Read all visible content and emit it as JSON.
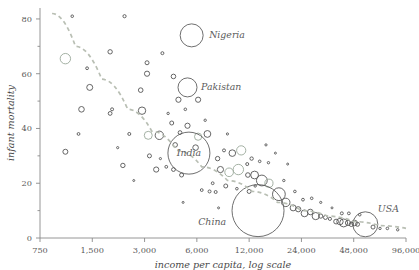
{
  "chart_data": {
    "type": "scatter",
    "title": "",
    "subtitle": "",
    "xlabel": "income per capita, log scale",
    "ylabel": "infant mortality",
    "xscale": "log",
    "yscale": "linear",
    "xlim": [
      750,
      96000
    ],
    "ylim": [
      0,
      84
    ],
    "xticks": [
      750,
      1500,
      3000,
      6000,
      12000,
      24000,
      48000,
      96000
    ],
    "xticklabels": [
      "750",
      "1,500",
      "3,000",
      "6,000",
      "12,000",
      "24,000",
      "48,000",
      "96,000"
    ],
    "yticks": [
      0,
      20,
      40,
      60,
      80
    ],
    "yticklabels": [
      "0",
      "20",
      "40",
      "60",
      "80"
    ],
    "yminorticks": [
      10,
      30,
      50,
      70
    ],
    "grid": false,
    "legend": null,
    "size_encoding": "population",
    "marker": "open-circle",
    "colors": {
      "bubble_stroke_dark": "#555555",
      "bubble_stroke_light": "#9aa89a",
      "trendline": "#b9bfb4",
      "axis": "#8a8a8a",
      "text": "#5a5a5a"
    },
    "annotations": [
      {
        "name": "Nigeria",
        "x": 5600,
        "y": 74,
        "r": 11.5,
        "label_dx": 14,
        "label_dy": 3
      },
      {
        "name": "Pakistan",
        "x": 5300,
        "y": 55,
        "r": 9.5,
        "label_dx": 12,
        "label_dy": 3
      },
      {
        "name": "India",
        "x": 5400,
        "y": 31,
        "r": 21,
        "label_dx": 0,
        "label_dy": 3,
        "label_inside": true
      },
      {
        "name": "China",
        "x": 13500,
        "y": 10,
        "r": 26,
        "label_dx": -32,
        "label_dy": 14
      },
      {
        "name": "USA",
        "x": 56000,
        "y": 5,
        "r": 12.5,
        "label_dx": 8,
        "label_dy": -12
      }
    ],
    "trendline_points": [
      {
        "x": 880,
        "y": 82
      },
      {
        "x": 1200,
        "y": 70
      },
      {
        "x": 1700,
        "y": 58
      },
      {
        "x": 2400,
        "y": 47
      },
      {
        "x": 3300,
        "y": 39
      },
      {
        "x": 4600,
        "y": 32
      },
      {
        "x": 6400,
        "y": 26
      },
      {
        "x": 9000,
        "y": 21
      },
      {
        "x": 12500,
        "y": 17
      },
      {
        "x": 17500,
        "y": 13
      },
      {
        "x": 24000,
        "y": 10
      },
      {
        "x": 34000,
        "y": 8
      },
      {
        "x": 48000,
        "y": 6
      },
      {
        "x": 68000,
        "y": 4.5
      },
      {
        "x": 96000,
        "y": 3.5
      }
    ],
    "points": [
      {
        "x": 1150,
        "y": 81,
        "r": 1.3
      },
      {
        "x": 2300,
        "y": 81,
        "r": 1.6
      },
      {
        "x": 1900,
        "y": 68,
        "r": 2.2
      },
      {
        "x": 1050,
        "y": 65.5,
        "r": 5.2
      },
      {
        "x": 1400,
        "y": 62,
        "r": 1.4
      },
      {
        "x": 3100,
        "y": 64,
        "r": 2.0
      },
      {
        "x": 3100,
        "y": 60,
        "r": 2.6
      },
      {
        "x": 4400,
        "y": 59,
        "r": 2.3
      },
      {
        "x": 1450,
        "y": 55,
        "r": 3.0
      },
      {
        "x": 2850,
        "y": 54,
        "r": 2.3
      },
      {
        "x": 5300,
        "y": 55,
        "r": 9.5
      },
      {
        "x": 4700,
        "y": 50.5,
        "r": 2.6
      },
      {
        "x": 6100,
        "y": 50.5,
        "r": 2.6
      },
      {
        "x": 5150,
        "y": 47,
        "r": 1.3
      },
      {
        "x": 1300,
        "y": 47,
        "r": 2.8
      },
      {
        "x": 1950,
        "y": 47,
        "r": 1.5
      },
      {
        "x": 1900,
        "y": 45.5,
        "r": 1.9
      },
      {
        "x": 2900,
        "y": 46.5,
        "r": 3.7
      },
      {
        "x": 4100,
        "y": 45.5,
        "r": 1.2
      },
      {
        "x": 3800,
        "y": 67.5,
        "r": 1.5
      },
      {
        "x": 5600,
        "y": 74,
        "r": 11.5
      },
      {
        "x": 4300,
        "y": 42,
        "r": 2.0
      },
      {
        "x": 5300,
        "y": 41,
        "r": 2.6
      },
      {
        "x": 4800,
        "y": 38.5,
        "r": 1.9
      },
      {
        "x": 1250,
        "y": 38,
        "r": 1.4
      },
      {
        "x": 2450,
        "y": 38,
        "r": 1.5
      },
      {
        "x": 3150,
        "y": 37.5,
        "r": 4.0
      },
      {
        "x": 3650,
        "y": 37.5,
        "r": 4.2
      },
      {
        "x": 6100,
        "y": 37,
        "r": 3.6
      },
      {
        "x": 6900,
        "y": 38,
        "r": 3.4
      },
      {
        "x": 4500,
        "y": 34,
        "r": 2.3
      },
      {
        "x": 5900,
        "y": 33,
        "r": 2.8
      },
      {
        "x": 5400,
        "y": 31,
        "r": 21
      },
      {
        "x": 1050,
        "y": 31.5,
        "r": 2.5
      },
      {
        "x": 2250,
        "y": 26.5,
        "r": 2.2
      },
      {
        "x": 3200,
        "y": 30,
        "r": 2.0
      },
      {
        "x": 3700,
        "y": 29,
        "r": 1.1
      },
      {
        "x": 4000,
        "y": 26,
        "r": 1.4
      },
      {
        "x": 3500,
        "y": 25,
        "r": 2.6
      },
      {
        "x": 4400,
        "y": 25,
        "r": 1.9
      },
      {
        "x": 4900,
        "y": 23,
        "r": 2.0
      },
      {
        "x": 7900,
        "y": 29,
        "r": 2.2
      },
      {
        "x": 8600,
        "y": 32,
        "r": 1.5
      },
      {
        "x": 9600,
        "y": 31,
        "r": 3.3
      },
      {
        "x": 10800,
        "y": 32,
        "r": 4.6
      },
      {
        "x": 12400,
        "y": 29,
        "r": 1.7
      },
      {
        "x": 8200,
        "y": 25,
        "r": 3.1
      },
      {
        "x": 9200,
        "y": 24,
        "r": 4.3
      },
      {
        "x": 10400,
        "y": 25,
        "r": 5.2
      },
      {
        "x": 11800,
        "y": 23,
        "r": 2.3
      },
      {
        "x": 7400,
        "y": 20,
        "r": 1.4
      },
      {
        "x": 8800,
        "y": 19,
        "r": 2.0
      },
      {
        "x": 6400,
        "y": 17.5,
        "r": 1.4
      },
      {
        "x": 7100,
        "y": 17,
        "r": 1.5
      },
      {
        "x": 7700,
        "y": 16.8,
        "r": 1.5
      },
      {
        "x": 10200,
        "y": 18,
        "r": 1.3
      },
      {
        "x": 12000,
        "y": 17,
        "r": 2.0
      },
      {
        "x": 13000,
        "y": 19,
        "r": 1.2
      },
      {
        "x": 12900,
        "y": 23,
        "r": 3.9
      },
      {
        "x": 14200,
        "y": 21,
        "r": 5.4
      },
      {
        "x": 15600,
        "y": 20,
        "r": 4.1
      },
      {
        "x": 11700,
        "y": 27,
        "r": 1.5
      },
      {
        "x": 13800,
        "y": 28,
        "r": 1.3
      },
      {
        "x": 15500,
        "y": 27.5,
        "r": 1.2
      },
      {
        "x": 13500,
        "y": 10,
        "r": 26
      },
      {
        "x": 17800,
        "y": 16,
        "r": 6.4
      },
      {
        "x": 19500,
        "y": 13,
        "r": 4.2
      },
      {
        "x": 21500,
        "y": 11,
        "r": 3.0
      },
      {
        "x": 23000,
        "y": 10.5,
        "r": 2.6
      },
      {
        "x": 25000,
        "y": 9,
        "r": 3.4
      },
      {
        "x": 27000,
        "y": 9.5,
        "r": 2.8
      },
      {
        "x": 29000,
        "y": 8,
        "r": 3.6
      },
      {
        "x": 31000,
        "y": 8,
        "r": 2.1
      },
      {
        "x": 33000,
        "y": 7.5,
        "r": 2.0
      },
      {
        "x": 35000,
        "y": 7,
        "r": 1.6
      },
      {
        "x": 24500,
        "y": 14,
        "r": 1.4
      },
      {
        "x": 27500,
        "y": 14.5,
        "r": 1.3
      },
      {
        "x": 31000,
        "y": 13,
        "r": 1.1
      },
      {
        "x": 22000,
        "y": 17,
        "r": 1.3
      },
      {
        "x": 19000,
        "y": 21,
        "r": 1.2
      },
      {
        "x": 38000,
        "y": 6,
        "r": 2.4
      },
      {
        "x": 40000,
        "y": 6,
        "r": 3.2
      },
      {
        "x": 42000,
        "y": 5.5,
        "r": 4.0
      },
      {
        "x": 44500,
        "y": 5.5,
        "r": 2.6
      },
      {
        "x": 46500,
        "y": 5,
        "r": 2.2
      },
      {
        "x": 48500,
        "y": 5.5,
        "r": 2.8
      },
      {
        "x": 50500,
        "y": 5,
        "r": 2.0
      },
      {
        "x": 56000,
        "y": 5,
        "r": 12.5
      },
      {
        "x": 41000,
        "y": 9,
        "r": 1.5
      },
      {
        "x": 45000,
        "y": 9,
        "r": 1.4
      },
      {
        "x": 52000,
        "y": 8.5,
        "r": 1.3
      },
      {
        "x": 62000,
        "y": 4,
        "r": 2.0
      },
      {
        "x": 68000,
        "y": 3.5,
        "r": 1.2
      },
      {
        "x": 75000,
        "y": 3.5,
        "r": 1.3
      },
      {
        "x": 86000,
        "y": 3,
        "r": 1.2
      },
      {
        "x": 2100,
        "y": 33,
        "r": 1.1
      },
      {
        "x": 6700,
        "y": 43,
        "r": 1.2
      },
      {
        "x": 9000,
        "y": 38,
        "r": 1.1
      },
      {
        "x": 15000,
        "y": 34,
        "r": 1.1
      },
      {
        "x": 17000,
        "y": 31,
        "r": 1.0
      },
      {
        "x": 20000,
        "y": 27,
        "r": 1.0
      },
      {
        "x": 36000,
        "y": 11,
        "r": 1.0
      },
      {
        "x": 2600,
        "y": 21,
        "r": 1.0
      },
      {
        "x": 5000,
        "y": 13,
        "r": 1.0
      },
      {
        "x": 8000,
        "y": 11,
        "r": 1.0
      }
    ]
  }
}
